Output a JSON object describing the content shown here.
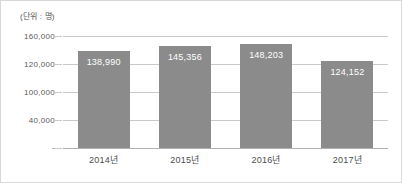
{
  "chart_data": {
    "type": "bar",
    "title": "",
    "subtitle": "",
    "unit_caption": "(단위 : 명)",
    "xlabel": "",
    "ylabel": "",
    "categories": [
      "2014년",
      "2015년",
      "2016년",
      "2017년"
    ],
    "values": [
      138990,
      145356,
      148203,
      124152
    ],
    "value_labels": [
      "138,990",
      "145,356",
      "148,203",
      "124,152"
    ],
    "series": [
      {
        "name": "",
        "values": [
          138990,
          145356,
          148203,
          124152
        ]
      }
    ],
    "ylim": [
      0,
      160000
    ],
    "yticks": [
      0,
      40000,
      100000,
      120000,
      160000
    ],
    "ytick_labels": [
      "-",
      "40,000",
      "100,000",
      "120,000",
      "160,000"
    ],
    "grid": true,
    "legend": "none",
    "bar_color": "#8b8b8b",
    "gridline_color": "#c9c9c9",
    "value_label_color": "#ffffff",
    "axis_text_color": "#5a5a5a",
    "background_color": "#ffffff",
    "border_color": "#d8d8d8"
  },
  "y_ticks": [
    {
      "label": "160,000",
      "value": 160000
    },
    {
      "label": "120,000",
      "value": 120000
    },
    {
      "label": "100,000",
      "value": 100000
    },
    {
      "label": "40,000",
      "value": 40000
    },
    {
      "label": "-",
      "value": 0
    }
  ],
  "bars": [
    {
      "category": "2014년",
      "value_label": "138,990",
      "value": 138990
    },
    {
      "category": "2015년",
      "value_label": "145,356",
      "value": 145356
    },
    {
      "category": "2016년",
      "value_label": "148,203",
      "value": 148203
    },
    {
      "category": "2017년",
      "value_label": "124,152",
      "value": 124152
    }
  ]
}
